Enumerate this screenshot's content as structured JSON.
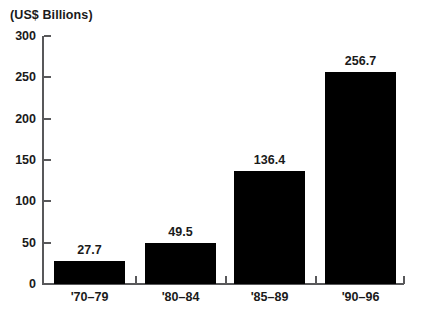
{
  "chart_data": {
    "type": "bar",
    "title": "",
    "subtitle": "",
    "xlabel": "",
    "ylabel": "(US$ Billions)",
    "categories": [
      "'70–79",
      "'80–84",
      "'85–89",
      "'90–96"
    ],
    "values": [
      27.7,
      49.5,
      136.4,
      256.7
    ],
    "value_labels": [
      "27.7",
      "49.5",
      "136.4",
      "256.7"
    ],
    "ylim": [
      0,
      300
    ],
    "yticks": [
      0,
      50,
      100,
      150,
      200,
      250,
      300
    ],
    "ytick_labels": [
      "0",
      "50",
      "100",
      "150",
      "200",
      "250",
      "300"
    ],
    "grid": false,
    "legend": false,
    "legend_position": "none",
    "bar_color": "#000000",
    "axis_color": "#58585a",
    "text_color": "#1a1a1a",
    "background_color": "#ffffff"
  }
}
